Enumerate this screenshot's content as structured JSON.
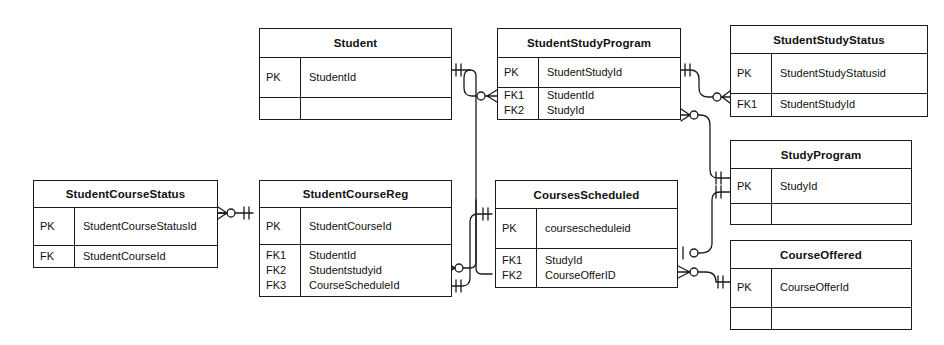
{
  "diagram": {
    "notation": "crow's-foot (IE) entity relationship diagram",
    "colors": {
      "line": "#1b1b1b",
      "background": "#ffffff",
      "text": "#111111"
    },
    "key_labels": {
      "pk": "PK",
      "fk": "FK",
      "fk1": "FK1",
      "fk2": "FK2",
      "fk3": "FK3"
    }
  },
  "entities": {
    "student": {
      "name": "Student",
      "pk_rows": [
        {
          "key": "PK",
          "attr": "StudentId"
        }
      ],
      "fk_rows": []
    },
    "student_study_program": {
      "name": "StudentStudyProgram",
      "pk_rows": [
        {
          "key": "PK",
          "attr": "StudentStudyId"
        }
      ],
      "fk_rows": [
        {
          "key": "FK1",
          "attr": "StudentId"
        },
        {
          "key": "FK2",
          "attr": "StudyId"
        }
      ]
    },
    "student_study_status": {
      "name": "StudentStudyStatus",
      "pk_rows": [
        {
          "key": "PK",
          "attr": "StudentStudyStatusid"
        }
      ],
      "fk_rows": [
        {
          "key": "FK1",
          "attr": "StudentStudyId"
        }
      ]
    },
    "study_program": {
      "name": "StudyProgram",
      "pk_rows": [
        {
          "key": "PK",
          "attr": "StudyId"
        }
      ],
      "fk_rows": []
    },
    "student_course_status": {
      "name": "StudentCourseStatus",
      "pk_rows": [
        {
          "key": "PK",
          "attr": "StudentCourseStatusId"
        }
      ],
      "fk_rows": [
        {
          "key": "FK",
          "attr": "StudentCourseId"
        }
      ]
    },
    "student_course_reg": {
      "name": "StudentCourseReg",
      "pk_rows": [
        {
          "key": "PK",
          "attr": "StudentCourseId"
        }
      ],
      "fk_rows": [
        {
          "key": "FK1",
          "attr": "StudentId"
        },
        {
          "key": "FK2",
          "attr": "Studentstudyid"
        },
        {
          "key": "FK3",
          "attr": "CourseScheduleId"
        }
      ]
    },
    "courses_scheduled": {
      "name": "CoursesScheduled",
      "pk_rows": [
        {
          "key": "PK",
          "attr": "coursescheduleid"
        }
      ],
      "fk_rows": [
        {
          "key": "FK1",
          "attr": "StudyId"
        },
        {
          "key": "FK2",
          "attr": "CourseOfferID"
        }
      ]
    },
    "course_offered": {
      "name": "CourseOffered",
      "pk_rows": [
        {
          "key": "PK",
          "attr": "CourseOfferId"
        }
      ],
      "fk_rows": []
    }
  },
  "relationships": [
    {
      "from": "Student",
      "to": "StudentStudyProgram",
      "from_cardinality": "one-and-only-one",
      "to_cardinality": "zero-or-many"
    },
    {
      "from": "Student",
      "to": "StudentCourseReg",
      "from_cardinality": "one-and-only-one",
      "to_cardinality": "zero-or-many"
    },
    {
      "from": "StudentStudyProgram",
      "to": "StudentStudyStatus",
      "from_cardinality": "one-and-only-one",
      "to_cardinality": "zero-or-many"
    },
    {
      "from": "StudyProgram",
      "to": "StudentStudyProgram",
      "from_cardinality": "one-and-only-one",
      "to_cardinality": "zero-or-many"
    },
    {
      "from": "StudyProgram",
      "to": "CoursesScheduled",
      "from_cardinality": "one-and-only-one",
      "to_cardinality": "zero-or-one"
    },
    {
      "from": "CourseOffered",
      "to": "CoursesScheduled",
      "from_cardinality": "one-and-only-one",
      "to_cardinality": "zero-or-many"
    },
    {
      "from": "CoursesScheduled",
      "to": "StudentCourseReg",
      "from_cardinality": "one-and-only-one",
      "to_cardinality": "one-and-only-one"
    },
    {
      "from": "StudentCourseReg",
      "to": "StudentCourseStatus",
      "from_cardinality": "one-and-only-one",
      "to_cardinality": "zero-or-many"
    }
  ]
}
